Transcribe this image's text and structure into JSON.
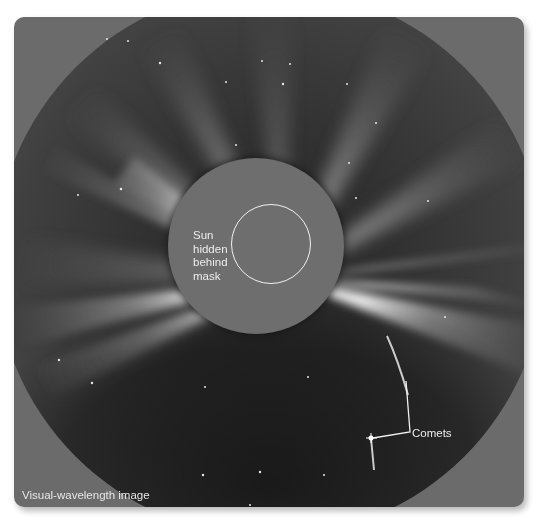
{
  "figure": {
    "type": "coronagraph visual-wavelength image",
    "caption": "Visual-wavelength image",
    "annotations": {
      "sun_label": "Sun hidden behind mask",
      "sun_label_lines": [
        "Sun",
        "hidden",
        "behind",
        "mask"
      ],
      "comets_label": "Comets"
    },
    "colors": {
      "panel_background": "#6b6b6b",
      "occulting_mask": "#6e6e6e",
      "sky_dark": "#2a2a2a",
      "streamer_bright": "#ffffff",
      "annotation_text": "#ececec"
    }
  }
}
